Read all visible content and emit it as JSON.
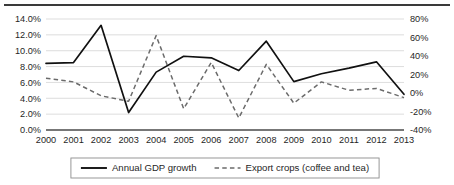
{
  "chart_data": {
    "type": "line",
    "title": "",
    "subtitle": "",
    "xlabel": "",
    "ylabel": "",
    "grid": true,
    "legend_position": "bottom-center",
    "categories": [
      "2000",
      "2001",
      "2002",
      "2003",
      "2004",
      "2005",
      "2006",
      "2007",
      "2008",
      "2009",
      "2010",
      "2011",
      "2012",
      "2013"
    ],
    "axes": {
      "left": {
        "label": "",
        "ylim": [
          0.0,
          14.0
        ],
        "tick_values": [
          0.0,
          2.0,
          4.0,
          6.0,
          8.0,
          10.0,
          12.0,
          14.0
        ],
        "tick_labels": [
          "0.0%",
          "2.0%",
          "4.0%",
          "6.0%",
          "8.0%",
          "10.0%",
          "12.0%",
          "14.0%"
        ]
      },
      "right": {
        "label": "",
        "ylim": [
          -40,
          80
        ],
        "tick_values": [
          -40,
          -20,
          0,
          20,
          40,
          60,
          80
        ],
        "tick_labels": [
          "-40%",
          "-20%",
          "0%",
          "20%",
          "40%",
          "60%",
          "80%"
        ]
      }
    },
    "series": [
      {
        "name": "Annual GDP growth",
        "axis": "left",
        "style": "solid",
        "color": "#111111",
        "values": [
          8.4,
          8.5,
          13.2,
          2.2,
          7.3,
          9.3,
          9.1,
          7.5,
          11.2,
          6.1,
          7.1,
          7.8,
          8.6,
          4.5
        ]
      },
      {
        "name": "Export crops (coffee and tea)",
        "axis": "right",
        "style": "dashed",
        "color": "#6b6b6b",
        "values": [
          16,
          12,
          -3,
          -9,
          62,
          -17,
          33,
          -27,
          31,
          -11,
          12,
          3,
          5,
          -5
        ]
      }
    ]
  },
  "legend": {
    "items": [
      {
        "label": "Annual GDP growth",
        "style": "solid"
      },
      {
        "label": "Export crops (coffee and tea)",
        "style": "dashed"
      }
    ]
  }
}
